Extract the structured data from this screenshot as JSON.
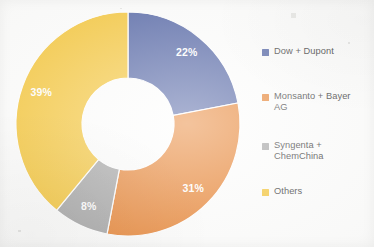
{
  "chart_data": {
    "type": "pie",
    "variant": "donut",
    "title": "",
    "subtitle": "",
    "xlabel": "",
    "ylabel": "",
    "grid": false,
    "legend_position": "right",
    "start_angle_deg": 0,
    "direction": "clockwise",
    "units": "percent",
    "categories": [
      "Dow + Dupont",
      "Monsanto + Bayer AG",
      "Syngenta + ChemChina",
      "Others"
    ],
    "values": [
      22,
      31,
      8,
      39
    ],
    "data_labels": [
      "22%",
      "31%",
      "8%",
      "39%"
    ],
    "colors": [
      "#5a6ba8",
      "#e8883a",
      "#a8a8a8",
      "#f5c842"
    ],
    "slices": [
      {
        "label": "Dow + Dupont",
        "value": 22,
        "data_label": "22%",
        "color": "#5a6ba8"
      },
      {
        "label": "Monsanto + Bayer AG",
        "value": 31,
        "data_label": "31%",
        "color": "#e8883a"
      },
      {
        "label": "Syngenta + ChemChina",
        "value": 8,
        "data_label": "8%",
        "color": "#a8a8a8"
      },
      {
        "label": "Others",
        "value": 39,
        "data_label": "39%",
        "color": "#f5c842"
      }
    ]
  },
  "legend": {
    "items": [
      {
        "label": "Dow + Dupont",
        "color": "#5a6ba8"
      },
      {
        "label": "Monsanto + Bayer\nAG",
        "color": "#e8883a"
      },
      {
        "label": "Syngenta +\nChemChina",
        "color": "#a8a8a8"
      },
      {
        "label": "Others",
        "color": "#f5c842"
      }
    ]
  },
  "theme": {
    "background": "#fdfdfc",
    "label_text_color": "#ffffff",
    "legend_text_color": "#4a4a4a"
  }
}
